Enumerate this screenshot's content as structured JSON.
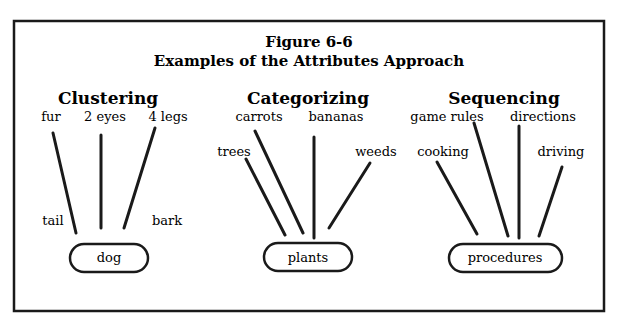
{
  "figure": {
    "number": "Figure 6-6",
    "title": "Examples of the Attributes Approach"
  },
  "groups": [
    {
      "heading": "Clustering",
      "center": "dog",
      "attributes": [
        "fur",
        "2 eyes",
        "4 legs",
        "tail",
        "bark"
      ]
    },
    {
      "heading": "Categorizing",
      "center": "plants",
      "attributes": [
        "carrots",
        "bananas",
        "trees",
        "weeds"
      ]
    },
    {
      "heading": "Sequencing",
      "center": "procedures",
      "attributes": [
        "game rules",
        "directions",
        "cooking",
        "driving"
      ]
    }
  ]
}
